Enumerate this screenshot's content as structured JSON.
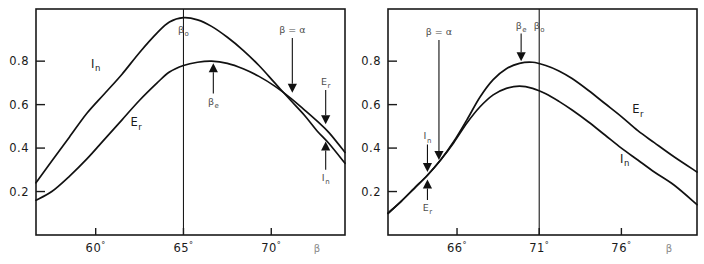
{
  "figure": {
    "name": "two-panel-curve-figure",
    "background": "#ffffff",
    "ink_color": "#111111",
    "annotation_color": "#4d4d4d"
  },
  "chart_data": [
    {
      "type": "line",
      "panel": "left",
      "title": "",
      "xlabel": "β",
      "ylabel": "",
      "xlim": [
        56.6,
        74.2
      ],
      "ylim": [
        0.0,
        1.04
      ],
      "grid": false,
      "legend": "inline-curve-labels",
      "x_ticks": [
        60,
        65,
        70
      ],
      "x_tick_labels": [
        "60°",
        "65°",
        "70°"
      ],
      "y_ticks": [
        0.2,
        0.4,
        0.6,
        0.8
      ],
      "y_tick_labels": [
        "0.2",
        "0.4",
        "0.6",
        "0.8"
      ],
      "vertical_markers": [
        {
          "label": "β",
          "sub": "o",
          "x": 65.0
        }
      ],
      "series": [
        {
          "name": "I_n",
          "label": "I",
          "label_sub": "n",
          "x": [
            56.6,
            57.5,
            58.5,
            59.5,
            60.5,
            61.5,
            62.5,
            63.5,
            64.2,
            65.0,
            65.8,
            66.6,
            67.5,
            68.4,
            69.3,
            70.2,
            71.1,
            71.9,
            72.6,
            73.3,
            74.2
          ],
          "values": [
            0.24,
            0.34,
            0.45,
            0.56,
            0.65,
            0.74,
            0.84,
            0.93,
            0.98,
            1.0,
            0.99,
            0.96,
            0.91,
            0.85,
            0.78,
            0.7,
            0.62,
            0.55,
            0.48,
            0.42,
            0.33
          ]
        },
        {
          "name": "E_r",
          "label": "E",
          "label_sub": "r",
          "x": [
            56.6,
            57.5,
            58.5,
            59.5,
            60.5,
            61.5,
            62.5,
            63.5,
            64.2,
            65.0,
            65.8,
            66.6,
            67.5,
            68.4,
            69.3,
            70.2,
            71.1,
            71.9,
            72.6,
            73.3,
            74.2
          ],
          "values": [
            0.16,
            0.2,
            0.27,
            0.35,
            0.44,
            0.53,
            0.62,
            0.7,
            0.75,
            0.78,
            0.795,
            0.8,
            0.79,
            0.765,
            0.73,
            0.685,
            0.63,
            0.575,
            0.525,
            0.47,
            0.38
          ]
        }
      ],
      "annotations": [
        {
          "name": "beta-zero-label",
          "text": "β",
          "sub": "o",
          "x": 65.0,
          "y": 0.93,
          "arrow": "none"
        },
        {
          "name": "beta-e-label",
          "text": "β",
          "sub": "e",
          "x": 66.7,
          "y": 0.6,
          "arrow": "up",
          "arrow_to_y": 0.79
        },
        {
          "name": "beta-equals-alpha-label",
          "text": "β = α",
          "x": 71.2,
          "y": 0.93,
          "arrow": "down",
          "arrow_to_y": 0.655
        },
        {
          "name": "er-pointer-label",
          "text": "E",
          "sub": "r",
          "x": 73.1,
          "y": 0.69,
          "arrow": "down",
          "arrow_to_y": 0.51
        },
        {
          "name": "in-pointer-label",
          "text": "I",
          "sub": "n",
          "x": 73.1,
          "y": 0.25,
          "arrow": "up",
          "arrow_to_y": 0.43
        }
      ],
      "curve_labels": [
        {
          "name": "in-curve-label",
          "text": "I",
          "sub": "n",
          "x": 60.0,
          "y": 0.77
        },
        {
          "name": "er-curve-label",
          "text": "E",
          "sub": "r",
          "x": 62.3,
          "y": 0.5
        }
      ]
    },
    {
      "type": "line",
      "panel": "right",
      "title": "",
      "xlabel": "β",
      "ylabel": "",
      "xlim": [
        61.8,
        80.6
      ],
      "ylim": [
        0.0,
        1.04
      ],
      "grid": false,
      "legend": "inline-curve-labels",
      "x_ticks": [
        66,
        71,
        76
      ],
      "x_tick_labels": [
        "66°",
        "71°",
        "76°"
      ],
      "y_ticks": [
        0.2,
        0.4,
        0.6,
        0.8
      ],
      "y_tick_labels": [
        "0.2",
        "0.4",
        "0.6",
        "0.8"
      ],
      "vertical_markers": [
        {
          "label": "β",
          "sub": "o",
          "x": 71.0
        }
      ],
      "series": [
        {
          "name": "E_r",
          "label": "E",
          "label_sub": "r",
          "x": [
            61.8,
            62.6,
            63.4,
            64.2,
            65.0,
            65.8,
            66.6,
            67.4,
            68.2,
            69.0,
            69.8,
            70.6,
            71.4,
            72.2,
            73.0,
            74.0,
            75.0,
            76.0,
            77.0,
            78.0,
            79.2,
            80.6
          ],
          "values": [
            0.1,
            0.155,
            0.215,
            0.275,
            0.345,
            0.43,
            0.53,
            0.635,
            0.715,
            0.765,
            0.79,
            0.795,
            0.78,
            0.755,
            0.72,
            0.665,
            0.605,
            0.545,
            0.48,
            0.425,
            0.36,
            0.29
          ]
        },
        {
          "name": "I_n",
          "label": "I",
          "label_sub": "n",
          "x": [
            61.8,
            62.6,
            63.4,
            64.2,
            65.0,
            65.8,
            66.6,
            67.4,
            68.2,
            69.0,
            69.8,
            70.6,
            71.4,
            72.2,
            73.0,
            74.0,
            75.0,
            76.0,
            77.0,
            78.0,
            79.2,
            80.6
          ],
          "values": [
            0.1,
            0.155,
            0.215,
            0.275,
            0.345,
            0.425,
            0.515,
            0.59,
            0.645,
            0.675,
            0.685,
            0.675,
            0.65,
            0.615,
            0.575,
            0.52,
            0.46,
            0.4,
            0.345,
            0.29,
            0.23,
            0.14
          ]
        }
      ],
      "annotations": [
        {
          "name": "beta-equals-alpha-label",
          "text": "β = α",
          "x": 64.9,
          "y": 0.92,
          "arrow": "down",
          "arrow_to_y": 0.345
        },
        {
          "name": "beta-e-label",
          "text": "β",
          "sub": "e",
          "x": 69.9,
          "y": 0.95,
          "arrow": "down",
          "arrow_to_y": 0.8
        },
        {
          "name": "beta-zero-label",
          "text": "β",
          "sub": "o",
          "x": 71.0,
          "y": 0.95,
          "arrow": "none"
        },
        {
          "name": "in-pointer-label",
          "text": "I",
          "sub": "n",
          "x": 64.2,
          "y": 0.44,
          "arrow": "down",
          "arrow_to_y": 0.29
        },
        {
          "name": "er-pointer-label",
          "text": "E",
          "sub": "r",
          "x": 64.2,
          "y": 0.11,
          "arrow": "up",
          "arrow_to_y": 0.255
        }
      ],
      "curve_labels": [
        {
          "name": "er-curve-label",
          "text": "E",
          "sub": "r",
          "x": 77.0,
          "y": 0.56
        },
        {
          "name": "in-curve-label",
          "text": "I",
          "sub": "n",
          "x": 76.2,
          "y": 0.33
        }
      ]
    }
  ]
}
